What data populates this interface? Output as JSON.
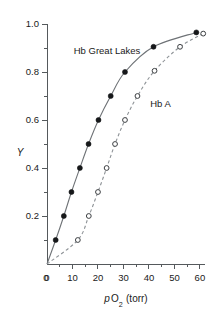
{
  "chart_data": {
    "type": "line",
    "title": "",
    "xlabel": "p O2 (torr)",
    "ylabel": "Y",
    "xlim": [
      0,
      62
    ],
    "ylim": [
      0,
      1.0
    ],
    "grid": false,
    "legend_position": "inline-annotations",
    "x_ticks": [
      0,
      10,
      20,
      30,
      40,
      50,
      60
    ],
    "x_tick_labels": [
      "0",
      "10",
      "20",
      "30",
      "40",
      "50",
      "60"
    ],
    "x_minor_ticks": [
      5,
      15,
      25,
      35,
      45,
      55
    ],
    "y_ticks": [
      0.2,
      0.4,
      0.6,
      0.8,
      1.0
    ],
    "y_tick_labels": [
      "0.2",
      "0.4",
      "0.6",
      "0.8",
      "1.0"
    ],
    "y_minor_ticks": [
      0.1,
      0.3,
      0.5,
      0.7,
      0.9
    ],
    "series": [
      {
        "name": "Hb Great Lakes",
        "marker": "filled-circle",
        "line": "solid",
        "label_x": 10.5,
        "label_y": 0.875,
        "points": [
          {
            "x": 3.4,
            "y": 0.1
          },
          {
            "x": 6.6,
            "y": 0.2
          },
          {
            "x": 9.6,
            "y": 0.3
          },
          {
            "x": 12.9,
            "y": 0.4
          },
          {
            "x": 16.3,
            "y": 0.5
          },
          {
            "x": 20.2,
            "y": 0.6
          },
          {
            "x": 25.0,
            "y": 0.7
          },
          {
            "x": 30.6,
            "y": 0.8
          },
          {
            "x": 41.8,
            "y": 0.905
          },
          {
            "x": 58.6,
            "y": 0.965
          }
        ]
      },
      {
        "name": "Hb A",
        "marker": "open-circle",
        "line": "dashed",
        "label_x": 40.5,
        "label_y": 0.655,
        "points": [
          {
            "x": 12.1,
            "y": 0.1
          },
          {
            "x": 16.4,
            "y": 0.2
          },
          {
            "x": 20.0,
            "y": 0.3
          },
          {
            "x": 23.4,
            "y": 0.4
          },
          {
            "x": 26.7,
            "y": 0.5
          },
          {
            "x": 30.6,
            "y": 0.6
          },
          {
            "x": 35.5,
            "y": 0.7
          },
          {
            "x": 42.2,
            "y": 0.805
          },
          {
            "x": 52.2,
            "y": 0.905
          },
          {
            "x": 61.3,
            "y": 0.96
          }
        ]
      }
    ]
  },
  "axis": {
    "y_title": "Y",
    "x_title_p": "p",
    "x_title_o": "O",
    "x_title_sub": "2",
    "x_title_unit": "(torr)",
    "origin_label": "0"
  }
}
